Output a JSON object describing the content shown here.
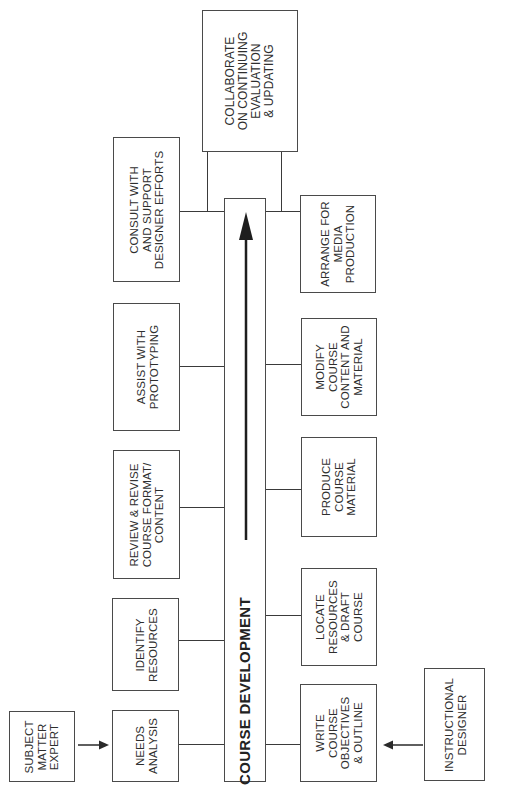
{
  "diagram": {
    "orientation": "rotated -90deg (read bottom-to-top)",
    "spine": {
      "label": "COURSE DEVELOPMENT",
      "arrow_direction": "up"
    },
    "actors": {
      "subject_matter_expert": "SUBJECT\nMATTER\nEXPERT",
      "instructional_designer": "INSTRUCTIONAL\nDESIGNER"
    },
    "sme_tasks": [
      {
        "id": "needs-analysis",
        "label": "NEEDS\nANALYSIS"
      },
      {
        "id": "identify-resources",
        "label": "IDENTIFY\nRESOURCES"
      },
      {
        "id": "review-revise",
        "label": "REVIEW & REVISE\nCOURSE FORMAT/\nCONTENT"
      },
      {
        "id": "assist-prototyping",
        "label": "ASSIST WITH\nPROTOTYPING"
      },
      {
        "id": "consult-support",
        "label": "CONSULT WITH\nAND SUPPORT\nDESIGNER EFFORTS"
      }
    ],
    "designer_tasks": [
      {
        "id": "write-objectives",
        "label": "WRITE\nCOURSE\nOBJECTIVES\n& OUTLINE"
      },
      {
        "id": "locate-resources",
        "label": "LOCATE\nRESOURCES\n& DRAFT\nCOURSE"
      },
      {
        "id": "produce-material",
        "label": "PRODUCE\nCOURSE\nMATERIAL"
      },
      {
        "id": "modify-content",
        "label": "MODIFY\nCOURSE\nCONTENT AND\nMATERIAL"
      },
      {
        "id": "arrange-media",
        "label": "ARRANGE FOR\nMEDIA\nPRODUCTION"
      }
    ],
    "shared_task": {
      "id": "collaborate",
      "label": "COLLABORATE\nON CONTINUING\nEVALUATION\n& UPDATING"
    }
  }
}
